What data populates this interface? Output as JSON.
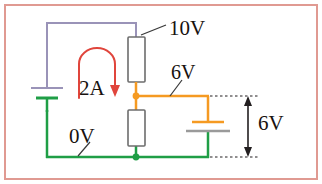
{
  "figure": {
    "frame_color": "#e09a92",
    "background": "#ffffff"
  },
  "colors": {
    "wire_10v": "#9a93b8",
    "wire_6v": "#f59a22",
    "wire_0v": "#1f9e46",
    "resistor_body": "#ffffff",
    "resistor_outline": "#6d6d6d",
    "current_arrow": "#e0453c",
    "dimension": "#231f20",
    "label_text": "#18120f"
  },
  "labels": {
    "top_supply": "10V",
    "mid_node": "6V",
    "current": "2A",
    "ground": "0V",
    "source_right": "6V"
  },
  "nodes": [
    {
      "name": "mid-node",
      "voltage": "6V",
      "color": "#f59a22"
    },
    {
      "name": "ground-node",
      "voltage": "0V",
      "color": "#1f9e46"
    }
  ],
  "components": [
    {
      "name": "battery-left",
      "type": "battery",
      "terminal_high": "10V",
      "terminal_low": "0V"
    },
    {
      "name": "resistor-upper",
      "type": "resistor",
      "top_voltage": "10V",
      "bottom_voltage": "6V"
    },
    {
      "name": "resistor-lower",
      "type": "resistor",
      "top_voltage": "6V",
      "bottom_voltage": "0V"
    },
    {
      "name": "battery-right",
      "type": "battery",
      "terminal_high": "6V",
      "terminal_low": "0V"
    }
  ],
  "annotations": {
    "current_loop": {
      "label": "2A",
      "direction": "clockwise"
    },
    "dimension_right": {
      "label": "6V",
      "style": "double-arrow-with-extension-lines"
    }
  }
}
